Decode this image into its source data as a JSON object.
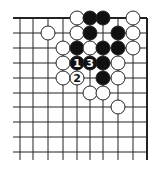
{
  "diagram": {
    "type": "go-board-fragment",
    "columns": 10,
    "rows": 10,
    "col_x": [
      20,
      33,
      48,
      63,
      77,
      90,
      103,
      118,
      133,
      147
    ],
    "row_y": [
      18,
      33,
      48,
      63,
      78,
      93,
      107,
      122,
      137,
      152
    ],
    "edges": {
      "top": true,
      "right": true,
      "left": false,
      "bottom": false
    },
    "stone_radius": 7,
    "colors": {
      "line": "#222222",
      "black": "#111111",
      "white": "#ffffff",
      "outline": "#222222"
    },
    "stones": [
      {
        "c": 4,
        "r": 0,
        "color": "white",
        "label": ""
      },
      {
        "c": 5,
        "r": 0,
        "color": "black",
        "label": ""
      },
      {
        "c": 6,
        "r": 0,
        "color": "black",
        "label": ""
      },
      {
        "c": 8,
        "r": 0,
        "color": "white",
        "label": ""
      },
      {
        "c": 2,
        "r": 1,
        "color": "white",
        "label": ""
      },
      {
        "c": 4,
        "r": 1,
        "color": "white",
        "label": ""
      },
      {
        "c": 5,
        "r": 1,
        "color": "black",
        "label": ""
      },
      {
        "c": 7,
        "r": 1,
        "color": "black",
        "label": ""
      },
      {
        "c": 8,
        "r": 1,
        "color": "white",
        "label": ""
      },
      {
        "c": 3,
        "r": 2,
        "color": "white",
        "label": ""
      },
      {
        "c": 4,
        "r": 2,
        "color": "black",
        "label": ""
      },
      {
        "c": 5,
        "r": 2,
        "color": "white",
        "label": ""
      },
      {
        "c": 6,
        "r": 2,
        "color": "black",
        "label": ""
      },
      {
        "c": 7,
        "r": 2,
        "color": "black",
        "label": ""
      },
      {
        "c": 8,
        "r": 2,
        "color": "white",
        "label": ""
      },
      {
        "c": 3,
        "r": 3,
        "color": "white",
        "label": ""
      },
      {
        "c": 4,
        "r": 3,
        "color": "black",
        "label": "1"
      },
      {
        "c": 5,
        "r": 3,
        "color": "black",
        "label": "3"
      },
      {
        "c": 6,
        "r": 3,
        "color": "black",
        "label": ""
      },
      {
        "c": 7,
        "r": 3,
        "color": "white",
        "label": ""
      },
      {
        "c": 3,
        "r": 4,
        "color": "white",
        "label": ""
      },
      {
        "c": 4,
        "r": 4,
        "color": "white",
        "label": "2"
      },
      {
        "c": 6,
        "r": 4,
        "color": "black",
        "label": ""
      },
      {
        "c": 7,
        "r": 4,
        "color": "white",
        "label": ""
      },
      {
        "c": 5,
        "r": 5,
        "color": "white",
        "label": ""
      },
      {
        "c": 6,
        "r": 5,
        "color": "white",
        "label": ""
      },
      {
        "c": 7,
        "r": 6,
        "color": "white",
        "label": ""
      }
    ]
  }
}
